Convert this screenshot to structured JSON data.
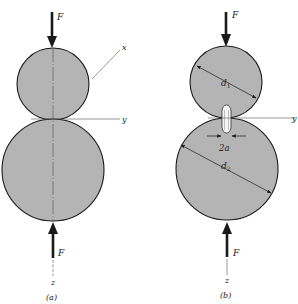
{
  "figure": {
    "panels": [
      {
        "id": "a",
        "caption": "(a)",
        "labels": {
          "force_top": "F",
          "force_bottom": "F",
          "x_axis": "x",
          "y_axis": "y",
          "z_axis": "z"
        }
      },
      {
        "id": "b",
        "caption": "(b)",
        "labels": {
          "force_top": "F",
          "force_bottom": "F",
          "y_axis": "y",
          "z_axis": "z",
          "diameter_small": "d",
          "diameter_small_sub": "1",
          "diameter_large": "d",
          "diameter_large_sub": "2",
          "contact_width": "2a"
        }
      }
    ],
    "colors": {
      "sphere_fill": "#b4b4b4",
      "outline": "#1a1a1a",
      "axis": "#555555",
      "background": "#ffffff"
    }
  }
}
